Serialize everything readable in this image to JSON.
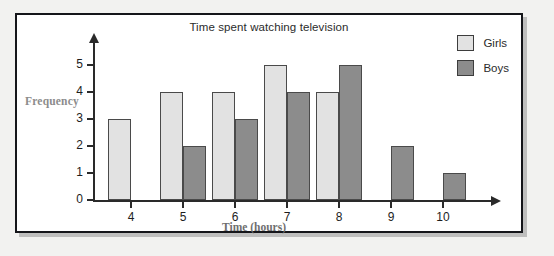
{
  "figure": {
    "title": "Time spent watching television",
    "legend": [
      {
        "label": "Girls",
        "color": "#e2e2e2"
      },
      {
        "label": "Boys",
        "color": "#8c8c8c"
      }
    ]
  },
  "chart_data": {
    "type": "bar",
    "title": "Time spent watching television",
    "xlabel": "Time (hours)",
    "ylabel": "Frequency",
    "categories": [
      "4",
      "5",
      "6",
      "7",
      "8",
      "9",
      "10"
    ],
    "series": [
      {
        "name": "Girls",
        "color": "#e2e2e2",
        "values": [
          3,
          4,
          4,
          5,
          4,
          0,
          0
        ]
      },
      {
        "name": "Boys",
        "color": "#8c8c8c",
        "values": [
          0,
          2,
          3,
          4,
          5,
          2,
          1
        ]
      }
    ],
    "ylim": [
      0,
      5
    ],
    "yticks": [
      "0",
      "1",
      "2",
      "3",
      "4",
      "5"
    ],
    "xticks": [
      "4",
      "5",
      "6",
      "7",
      "8",
      "9",
      "10"
    ],
    "grid": false,
    "legend_position": "top-right"
  }
}
